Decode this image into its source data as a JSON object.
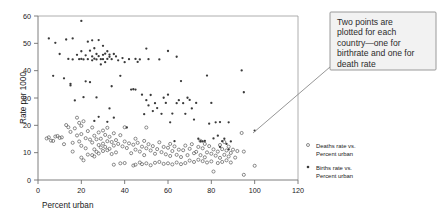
{
  "chart_data": {
    "type": "scatter",
    "title": "",
    "xlabel": "Percent urban",
    "ylabel": "Rate per 1000",
    "xlim": [
      0,
      120
    ],
    "ylim": [
      0,
      60
    ],
    "xticks": [
      0,
      20,
      40,
      60,
      80,
      100,
      120
    ],
    "yticks": [
      0,
      10,
      20,
      30,
      40,
      50,
      60
    ],
    "grid": false,
    "legend_position": "right",
    "series": [
      {
        "name": "Deaths rate vs. Percent urban",
        "marker": "open-circle",
        "points": [
          [
            4,
            15.2
          ],
          [
            5,
            15.6
          ],
          [
            6,
            14.4
          ],
          [
            7,
            14.3
          ],
          [
            8,
            15.9
          ],
          [
            9,
            16.1
          ],
          [
            10,
            15.4
          ],
          [
            11,
            15.6
          ],
          [
            12,
            13.1
          ],
          [
            13,
            20.1
          ],
          [
            14,
            19.3
          ],
          [
            15,
            17.6
          ],
          [
            16,
            13.6
          ],
          [
            16,
            10.4
          ],
          [
            17,
            18.9
          ],
          [
            18,
            22.8
          ],
          [
            18,
            16.3
          ],
          [
            19,
            20.9
          ],
          [
            19,
            14.1
          ],
          [
            20,
            19.8
          ],
          [
            20,
            16.8
          ],
          [
            20,
            12.5
          ],
          [
            20,
            8.2
          ],
          [
            21,
            21.5
          ],
          [
            21,
            7.2
          ],
          [
            22,
            15.3
          ],
          [
            22,
            11.6
          ],
          [
            23,
            17.9
          ],
          [
            23,
            9.3
          ],
          [
            24,
            14.8
          ],
          [
            25,
            19.2
          ],
          [
            25,
            13.7
          ],
          [
            25,
            9.1
          ],
          [
            26,
            16.2
          ],
          [
            26,
            11.2
          ],
          [
            26,
            8.6
          ],
          [
            27,
            14.9
          ],
          [
            27,
            10.3
          ],
          [
            28,
            17.4
          ],
          [
            28,
            12.8
          ],
          [
            28,
            9.7
          ],
          [
            29,
            15.1
          ],
          [
            29,
            11.9
          ],
          [
            30,
            18.1
          ],
          [
            30,
            13.3
          ],
          [
            30,
            10.6
          ],
          [
            31,
            16.5
          ],
          [
            31,
            12.1
          ],
          [
            32,
            19.1
          ],
          [
            32,
            14.2
          ],
          [
            32,
            10.9
          ],
          [
            33,
            15.8
          ],
          [
            33,
            11.4
          ],
          [
            34,
            13.9
          ],
          [
            34,
            9.5
          ],
          [
            35,
            17.1
          ],
          [
            35,
            12.6
          ],
          [
            35,
            5.6
          ],
          [
            36,
            14.6
          ],
          [
            36,
            10.1
          ],
          [
            37,
            13.2
          ],
          [
            38,
            16.4
          ],
          [
            38,
            6.1
          ],
          [
            39,
            12.3
          ],
          [
            40,
            19.3
          ],
          [
            40,
            14.1
          ],
          [
            40,
            6.2
          ],
          [
            41,
            11.7
          ],
          [
            42,
            13.4
          ],
          [
            43,
            9.8
          ],
          [
            44,
            12.9
          ],
          [
            44,
            5.3
          ],
          [
            45,
            15.1
          ],
          [
            45,
            11.1
          ],
          [
            45,
            5.6
          ],
          [
            46,
            13.6
          ],
          [
            47,
            10.4
          ],
          [
            47,
            6.4
          ],
          [
            48,
            12.2
          ],
          [
            48,
            5.8
          ],
          [
            49,
            14.3
          ],
          [
            49,
            9.1
          ],
          [
            50,
            19.2
          ],
          [
            50,
            11.6
          ],
          [
            50,
            6.1
          ],
          [
            51,
            13.1
          ],
          [
            52,
            10.8
          ],
          [
            52,
            5.4
          ],
          [
            53,
            12.4
          ],
          [
            54,
            9.6
          ],
          [
            54,
            6.3
          ],
          [
            55,
            11.3
          ],
          [
            56,
            13.8
          ],
          [
            56,
            6.6
          ],
          [
            57,
            10.2
          ],
          [
            58,
            12.1
          ],
          [
            58,
            5.9
          ],
          [
            59,
            9.4
          ],
          [
            60,
            11.8
          ],
          [
            60,
            6.1
          ],
          [
            61,
            13.2
          ],
          [
            61,
            8.8
          ],
          [
            62,
            10.6
          ],
          [
            62,
            5.7
          ],
          [
            63,
            12.3
          ],
          [
            64,
            9.2
          ],
          [
            64,
            6.4
          ],
          [
            65,
            11.1
          ],
          [
            66,
            8.4
          ],
          [
            66,
            5.8
          ],
          [
            67,
            10.9
          ],
          [
            68,
            12.6
          ],
          [
            68,
            6.2
          ],
          [
            69,
            9.1
          ],
          [
            70,
            11.4
          ],
          [
            70,
            7.1
          ],
          [
            71,
            13.1
          ],
          [
            72,
            9.8
          ],
          [
            72,
            6.6
          ],
          [
            73,
            10.3
          ],
          [
            74,
            12.1
          ],
          [
            74,
            7.4
          ],
          [
            75,
            14.3
          ],
          [
            75,
            9.1
          ],
          [
            76,
            11.6
          ],
          [
            76,
            6.9
          ],
          [
            77,
            13.2
          ],
          [
            77,
            8.3
          ],
          [
            78,
            10.1
          ],
          [
            78,
            6.4
          ],
          [
            79,
            12.4
          ],
          [
            80,
            9.6
          ],
          [
            80,
            6.8
          ],
          [
            81,
            11.2
          ],
          [
            81,
            3.1
          ],
          [
            82,
            8.9
          ],
          [
            83,
            10.4
          ],
          [
            83,
            6.2
          ],
          [
            84,
            12.8
          ],
          [
            84,
            8.1
          ],
          [
            85,
            11.3
          ],
          [
            85,
            6.6
          ],
          [
            86,
            13.9
          ],
          [
            86,
            9.2
          ],
          [
            87,
            10.8
          ],
          [
            87,
            7.2
          ],
          [
            88,
            12.2
          ],
          [
            88,
            8.6
          ],
          [
            89,
            9.9
          ],
          [
            89,
            6.4
          ],
          [
            90,
            11.1
          ],
          [
            91,
            8.2
          ],
          [
            92,
            10.6
          ],
          [
            94,
            17.2
          ],
          [
            95,
            10.4
          ],
          [
            95,
            1.9
          ],
          [
            100,
            5.2
          ]
        ]
      },
      {
        "name": "Births rate vs. Percent urban",
        "marker": "filled-dot",
        "points": [
          [
            5,
            51.8
          ],
          [
            7,
            38.1
          ],
          [
            8,
            50.2
          ],
          [
            10,
            46.1
          ],
          [
            12,
            37.2
          ],
          [
            13,
            51.4
          ],
          [
            14,
            44.3
          ],
          [
            15,
            34.6
          ],
          [
            15,
            35.2
          ],
          [
            16,
            51.8
          ],
          [
            16,
            44.1
          ],
          [
            17,
            29.1
          ],
          [
            18,
            45.8
          ],
          [
            19,
            44.2
          ],
          [
            20,
            58.2
          ],
          [
            20,
            47.1
          ],
          [
            20,
            44.3
          ],
          [
            21,
            44.1
          ],
          [
            21,
            30.3
          ],
          [
            22,
            45.6
          ],
          [
            22,
            36.1
          ],
          [
            23,
            50.6
          ],
          [
            23,
            44.2
          ],
          [
            24,
            47.3
          ],
          [
            24,
            35.8
          ],
          [
            25,
            51.1
          ],
          [
            25,
            45.2
          ],
          [
            25,
            43.8
          ],
          [
            26,
            48.2
          ],
          [
            26,
            44.4
          ],
          [
            26,
            21.6
          ],
          [
            27,
            46.1
          ],
          [
            27,
            44.1
          ],
          [
            27,
            30.2
          ],
          [
            28,
            51.2
          ],
          [
            28,
            45.3
          ],
          [
            28,
            23.1
          ],
          [
            29,
            44.2
          ],
          [
            29,
            42.3
          ],
          [
            30,
            49.1
          ],
          [
            30,
            45.8
          ],
          [
            30,
            44.2
          ],
          [
            31,
            46.2
          ],
          [
            31,
            43.1
          ],
          [
            32,
            47.1
          ],
          [
            32,
            44.3
          ],
          [
            32,
            21.3
          ],
          [
            33,
            45.9
          ],
          [
            33,
            45.1
          ],
          [
            33,
            26.2
          ],
          [
            34,
            44.2
          ],
          [
            34,
            34.3
          ],
          [
            35,
            46.1
          ],
          [
            35,
            22.8
          ],
          [
            36,
            45.2
          ],
          [
            37,
            43.8
          ],
          [
            38,
            38.1
          ],
          [
            39,
            44.6
          ],
          [
            40,
            43.1
          ],
          [
            41,
            19.2
          ],
          [
            42,
            44.2
          ],
          [
            43,
            33.1
          ],
          [
            44,
            33.2
          ],
          [
            45,
            33.1
          ],
          [
            45,
            44.3
          ],
          [
            46,
            43.2
          ],
          [
            47,
            44.1
          ],
          [
            48,
            31.2
          ],
          [
            49,
            24.1
          ],
          [
            50,
            48.1
          ],
          [
            50,
            29.2
          ],
          [
            51,
            44.2
          ],
          [
            51,
            27.3
          ],
          [
            52,
            31.1
          ],
          [
            53,
            25.2
          ],
          [
            54,
            28.1
          ],
          [
            55,
            26.3
          ],
          [
            56,
            44.1
          ],
          [
            57,
            24.2
          ],
          [
            58,
            30.1
          ],
          [
            59,
            28.2
          ],
          [
            60,
            47.2
          ],
          [
            60,
            31.2
          ],
          [
            61,
            21.1
          ],
          [
            62,
            24.3
          ],
          [
            63,
            14.2
          ],
          [
            64,
            28.1
          ],
          [
            64,
            45.1
          ],
          [
            65,
            29.2
          ],
          [
            66,
            36.2
          ],
          [
            67,
            28.1
          ],
          [
            68,
            24.2
          ],
          [
            69,
            30.1
          ],
          [
            70,
            29.3
          ],
          [
            71,
            26.2
          ],
          [
            72,
            22.1
          ],
          [
            73,
            28.2
          ],
          [
            74,
            15.1
          ],
          [
            75,
            14.2
          ],
          [
            76,
            14.1
          ],
          [
            77,
            14.3
          ],
          [
            78,
            38.2
          ],
          [
            79,
            20.6
          ],
          [
            80,
            28.2
          ],
          [
            81,
            15.2
          ],
          [
            82,
            21.1
          ],
          [
            83,
            16.2
          ],
          [
            84,
            21.2
          ],
          [
            84,
            12.1
          ],
          [
            85,
            14.2
          ],
          [
            86,
            15.1
          ],
          [
            87,
            13.2
          ],
          [
            88,
            21.1
          ],
          [
            88,
            11.2
          ],
          [
            89,
            14.1
          ],
          [
            94,
            40.1
          ],
          [
            95,
            32.1
          ],
          [
            100,
            18.1
          ]
        ]
      }
    ],
    "annotation": {
      "text": "Two points are plotted for each country—one for birthrate and one for death rate",
      "lines": [
        "Two points are",
        "plotted for each",
        "country—one for",
        "birthrate and one for",
        "death rate"
      ],
      "target_point": [
        95,
        17.2
      ]
    }
  },
  "legend": {
    "items": [
      {
        "label_line1": "Deaths rate vs.",
        "label_line2": "Percent urban",
        "marker": "open-circle"
      },
      {
        "label_line1": "Births rate vs.",
        "label_line2": "Percent urban",
        "marker": "filled-dot"
      }
    ]
  },
  "colors": {
    "background": "#ffffff",
    "axis": "#6f6f6f",
    "frame": "#9a9a9a",
    "deaths_marker": "#5a5a5a",
    "births_marker": "#3a3a3a",
    "callout_fill": "#f2f2f2",
    "callout_border": "#8f8f8f",
    "text": "#1a1a1a"
  }
}
